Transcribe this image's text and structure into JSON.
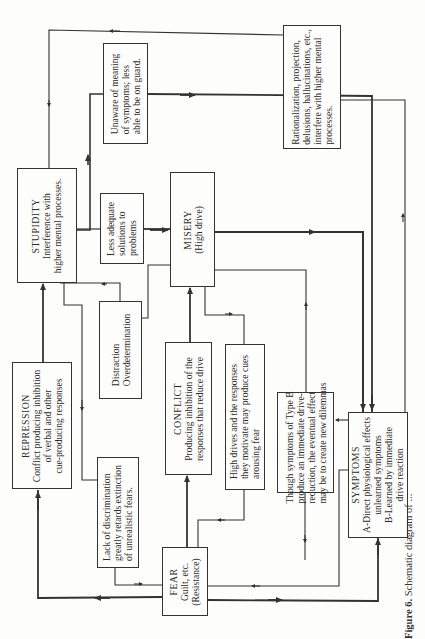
{
  "figure": {
    "caption_label": "Figure 6.",
    "caption_text": "Schematic diagram of ..."
  },
  "boxes": {
    "unaware": {
      "lines": [
        "Unaware of meaning",
        "of symptoms; less",
        "able to be on guard."
      ]
    },
    "rationalization": {
      "lines": [
        "Rationalization, projection,",
        "delusions, hallucinations, etc.,",
        "interfere with higher mental",
        "processes."
      ]
    },
    "stupidity": {
      "title": "STUPIDITY",
      "lines": [
        "Interference with",
        "higher mental processes."
      ]
    },
    "less_adequate": {
      "lines": [
        "Less adequate",
        "solutions to",
        "problems"
      ]
    },
    "misery": {
      "title": "MISERY",
      "lines": [
        "(High drive)"
      ]
    },
    "distraction": {
      "lines": [
        "Distraction",
        "Overdetermination"
      ]
    },
    "repression": {
      "title": "REPRESSION",
      "lines": [
        "Conflict producing inhibition",
        "of verbal and other",
        "cue-producing responses"
      ]
    },
    "conflict": {
      "title": "CONFLICT",
      "lines": [
        "Producing inhibition of the",
        "responses that reduce drive"
      ]
    },
    "lack_discrimination": {
      "lines": [
        "Lack of discrimination",
        "greatly retards extinction",
        "of unrealistic fears."
      ]
    },
    "high_drives": {
      "lines": [
        "High drives and the responses",
        "they motivate may produce cues",
        "arousing fear"
      ]
    },
    "though_symptoms": {
      "lines": [
        "Though symptoms of Type B",
        "produce an immediate drive-",
        "reduction, the eventual effect",
        "may be to create new dilemmas"
      ]
    },
    "symptoms": {
      "title": "SYMPTOMS",
      "lines": [
        "A-Direct physiological effects",
        "unlearned symptoms",
        "B-Learned by immediate",
        "drive reaction"
      ]
    },
    "fear": {
      "title": "FEAR",
      "lines": [
        "Guilt, etc.",
        "(Resistance)"
      ]
    }
  },
  "colors": {
    "ink": "#333333",
    "paper": "#fdfdfb"
  }
}
